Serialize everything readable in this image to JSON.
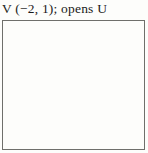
{
  "title": "V (−2, 1); opens U",
  "colors": {
    "ink": "#1b1b1b",
    "frame": "#6f6f6b",
    "background": "#fdfdfb"
  },
  "chart_data": {
    "type": "line",
    "title": "V (−2, 1); opens U",
    "function": "y = (x + 2)^2 + 1",
    "parabola": {
      "a": 1,
      "h": -2,
      "k": 1
    },
    "vertex": [
      -2,
      1
    ],
    "opens": "up",
    "xlabel": "x",
    "ylabel": "y",
    "xlim": [
      -5,
      5
    ],
    "ylim": [
      -5,
      5
    ],
    "x_tick_labels": [
      -4,
      -3,
      -2,
      -1,
      1,
      2,
      3,
      4,
      5
    ],
    "y_tick_labels": [
      1,
      2,
      3,
      4,
      5,
      -1,
      -2,
      -3,
      -4
    ],
    "grid": false,
    "legend": false,
    "points": [
      [
        -4,
        5
      ],
      [
        -3,
        2
      ],
      [
        -2,
        1
      ],
      [
        -1,
        2
      ],
      [
        0,
        5
      ]
    ]
  }
}
